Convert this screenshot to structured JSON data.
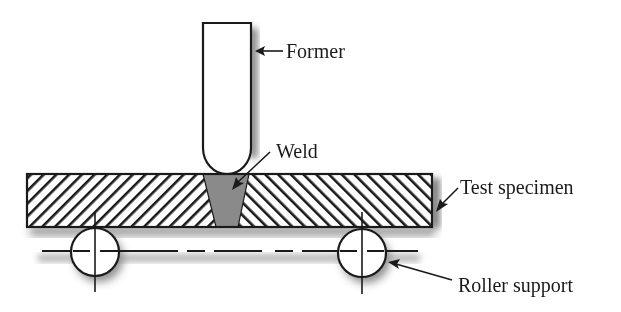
{
  "diagram": {
    "labels": {
      "former": "Former",
      "weld": "Weld",
      "test_specimen": "Test specimen",
      "roller_support": "Roller support"
    },
    "colors": {
      "line": "#1a1a1a",
      "weld_fill": "#8a8a8a",
      "shadow": "#9a9a9a",
      "background": "#ffffff"
    }
  }
}
